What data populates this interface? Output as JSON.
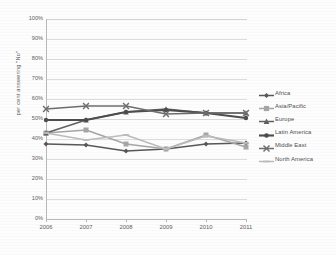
{
  "chart_data": {
    "type": "line",
    "title": "",
    "xlabel": "",
    "ylabel": "per cent answering \"No\"",
    "x": [
      "2006",
      "2007",
      "2008",
      "2009",
      "2010",
      "2011"
    ],
    "categories": [
      "2006",
      "2007",
      "2008",
      "2009",
      "2010",
      "2011"
    ],
    "ylim": [
      0,
      100
    ],
    "yticks": [
      "0%",
      "10%",
      "20%",
      "30%",
      "40%",
      "50%",
      "60%",
      "70%",
      "80%",
      "90%",
      "100%"
    ],
    "ytick_values": [
      0,
      10,
      20,
      30,
      40,
      50,
      60,
      70,
      80,
      90,
      100
    ],
    "grid": true,
    "legend_position": "right",
    "series": [
      {
        "name": "Africa",
        "values": [
          37.5,
          37.0,
          34.0,
          35.0,
          37.5,
          38.0
        ],
        "color": "#58585a",
        "marker": "diamond"
      },
      {
        "name": "Asia/Pacific",
        "values": [
          43.0,
          44.5,
          37.5,
          35.0,
          42.0,
          36.0
        ],
        "color": "#a6a6a6",
        "marker": "square"
      },
      {
        "name": "Europe",
        "values": [
          43.0,
          49.5,
          53.5,
          55.0,
          53.0,
          53.0
        ],
        "color": "#606062",
        "marker": "triangle"
      },
      {
        "name": "Latin America",
        "values": [
          49.5,
          49.5,
          53.5,
          54.5,
          53.0,
          50.5
        ],
        "color": "#4d4d4f",
        "marker": "circle"
      },
      {
        "name": "Middle East",
        "values": [
          55.0,
          56.5,
          56.5,
          52.5,
          53.0,
          53.0
        ],
        "color": "#6e6e70",
        "marker": "cross"
      },
      {
        "name": "North America",
        "values": [
          43.0,
          39.5,
          42.0,
          35.0,
          41.5,
          38.0
        ],
        "color": "#bcbcbc",
        "marker": "dash"
      }
    ]
  }
}
